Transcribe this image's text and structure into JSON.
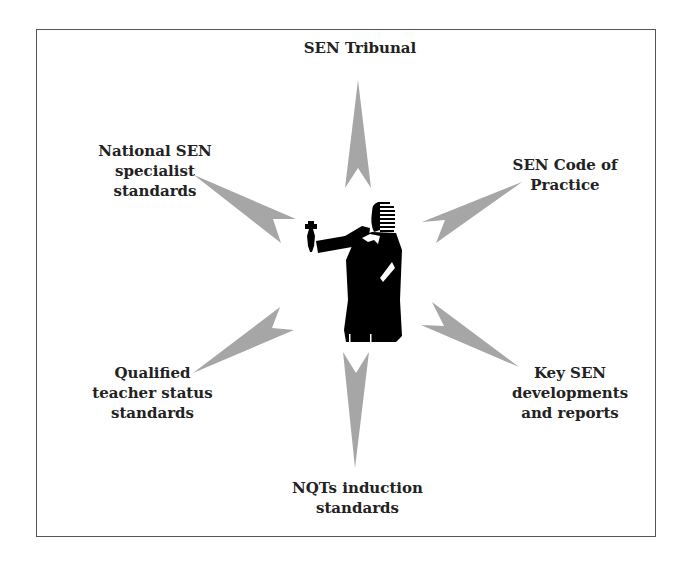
{
  "diagram": {
    "center": {
      "icon": "judge-with-gavel-icon"
    },
    "arrow_color": "#a6a6a6",
    "figure_color": "#000000",
    "nodes": [
      {
        "id": "top",
        "lines": [
          "SEN Tribunal"
        ]
      },
      {
        "id": "top-right",
        "lines": [
          "SEN Code of",
          "Practice"
        ]
      },
      {
        "id": "bottom-right",
        "lines": [
          "Key SEN",
          "developments",
          "and reports"
        ]
      },
      {
        "id": "bottom",
        "lines": [
          "NQTs induction",
          "standards"
        ]
      },
      {
        "id": "bottom-left",
        "lines": [
          "Qualified",
          "teacher status",
          "standards"
        ]
      },
      {
        "id": "top-left",
        "lines": [
          "National SEN",
          "specialist",
          "standards"
        ]
      }
    ]
  }
}
